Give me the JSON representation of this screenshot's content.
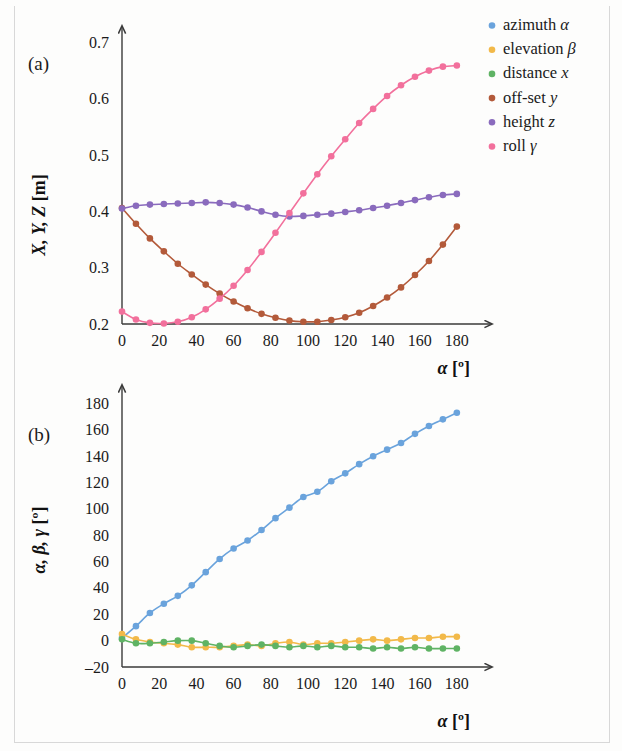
{
  "figure": {
    "panel_a_label": "(a)",
    "panel_b_label": "(b)"
  },
  "legend": {
    "position": "top-right",
    "items": [
      {
        "label": "azimuth",
        "symbol": "α",
        "color": "#6aa3dc",
        "key": "azimuth"
      },
      {
        "label": "elevation",
        "symbol": "β",
        "color": "#f2b949",
        "key": "elevation"
      },
      {
        "label": "distance",
        "symbol": "x",
        "color": "#5fb364",
        "key": "distance"
      },
      {
        "label": "off-set",
        "symbol": "y",
        "color": "#b35a3a",
        "key": "offset"
      },
      {
        "label": "height",
        "symbol": "z",
        "color": "#8a6bbd",
        "key": "height"
      },
      {
        "label": "roll",
        "symbol": "γ",
        "color": "#f2709c",
        "key": "roll"
      }
    ]
  },
  "chart_data": [
    {
      "id": "panel_a",
      "type": "line",
      "title": "",
      "panel": "(a)",
      "xlabel": "α [°]",
      "ylabel": "X, Y, Z [m]",
      "xlim": [
        0,
        186
      ],
      "ylim": [
        0.2,
        0.715
      ],
      "xticks": [
        0,
        20,
        40,
        60,
        80,
        100,
        120,
        140,
        160,
        180
      ],
      "yticks": [
        0.2,
        0.3,
        0.4,
        0.5,
        0.6,
        0.7
      ],
      "ytick_labels": [
        "0.2",
        "0.3",
        "0.4",
        "0.5",
        "0.6",
        "0.7"
      ],
      "xtick_labels": [
        "0",
        "20",
        "40",
        "60",
        "80",
        "100",
        "120",
        "140",
        "160",
        "180"
      ],
      "grid": false,
      "x": [
        0,
        7.5,
        15,
        22.5,
        30,
        37.5,
        45,
        52.5,
        60,
        67.5,
        75,
        82.5,
        90,
        97.5,
        105,
        112.5,
        120,
        127.5,
        135,
        142.5,
        150,
        157.5,
        165,
        172.5,
        180
      ],
      "series": [
        {
          "name": "off-set y",
          "key": "offset",
          "color": "#b35a3a",
          "values": [
            0.406,
            0.378,
            0.352,
            0.329,
            0.307,
            0.288,
            0.27,
            0.254,
            0.24,
            0.228,
            0.218,
            0.211,
            0.206,
            0.204,
            0.204,
            0.207,
            0.212,
            0.22,
            0.232,
            0.247,
            0.265,
            0.287,
            0.312,
            0.341,
            0.373
          ]
        },
        {
          "name": "height z",
          "key": "height",
          "color": "#8a6bbd",
          "values": [
            0.405,
            0.41,
            0.412,
            0.413,
            0.414,
            0.415,
            0.416,
            0.415,
            0.412,
            0.407,
            0.4,
            0.394,
            0.391,
            0.392,
            0.394,
            0.396,
            0.399,
            0.402,
            0.406,
            0.41,
            0.415,
            0.42,
            0.425,
            0.429,
            0.431
          ]
        },
        {
          "name": "roll γ",
          "key": "roll",
          "color": "#f2709c",
          "values": [
            0.222,
            0.208,
            0.202,
            0.201,
            0.204,
            0.212,
            0.226,
            0.245,
            0.268,
            0.296,
            0.328,
            0.362,
            0.397,
            0.432,
            0.466,
            0.498,
            0.528,
            0.557,
            0.582,
            0.605,
            0.624,
            0.639,
            0.65,
            0.657,
            0.659
          ]
        }
      ]
    },
    {
      "id": "panel_b",
      "type": "line",
      "title": "",
      "panel": "(b)",
      "xlabel": "α [°]",
      "ylabel": "α, β, γ [°]",
      "xlim": [
        0,
        186
      ],
      "ylim": [
        -20,
        188
      ],
      "xticks": [
        0,
        20,
        40,
        60,
        80,
        100,
        120,
        140,
        160,
        180
      ],
      "yticks": [
        -20,
        0,
        20,
        40,
        60,
        80,
        100,
        120,
        140,
        160,
        180
      ],
      "ytick_labels": [
        "–20",
        "0",
        "20",
        "40",
        "60",
        "80",
        "100",
        "120",
        "140",
        "160",
        "180"
      ],
      "xtick_labels": [
        "0",
        "20",
        "40",
        "60",
        "80",
        "100",
        "120",
        "140",
        "160",
        "180"
      ],
      "grid": false,
      "x": [
        0,
        7.5,
        15,
        22.5,
        30,
        37.5,
        45,
        52.5,
        60,
        67.5,
        75,
        82.5,
        90,
        97.5,
        105,
        112.5,
        120,
        127.5,
        135,
        142.5,
        150,
        157.5,
        165,
        172.5,
        180
      ],
      "series": [
        {
          "name": "azimuth α",
          "key": "azimuth",
          "color": "#6aa3dc",
          "values": [
            2,
            11,
            21,
            28,
            34,
            42,
            52,
            62,
            70,
            76,
            84,
            93,
            101,
            109,
            113,
            121,
            127,
            134,
            140,
            145,
            150,
            157,
            163,
            168,
            173
          ]
        },
        {
          "name": "elevation β",
          "key": "elevation",
          "color": "#f2b949",
          "values": [
            5,
            1,
            -1,
            -2,
            -3,
            -5,
            -5,
            -5,
            -4,
            -3,
            -4,
            -2,
            -1,
            -3,
            -2,
            -2,
            -1,
            0,
            1,
            0,
            1,
            2,
            2,
            3,
            3
          ]
        },
        {
          "name": "distance x",
          "key": "distance",
          "color": "#5fb364",
          "values": [
            1,
            -2,
            -2,
            -1,
            0,
            0,
            -2,
            -4,
            -5,
            -4,
            -3,
            -4,
            -5,
            -4,
            -5,
            -4,
            -5,
            -5,
            -6,
            -5,
            -6,
            -5,
            -6,
            -6,
            -6
          ]
        }
      ]
    }
  ]
}
